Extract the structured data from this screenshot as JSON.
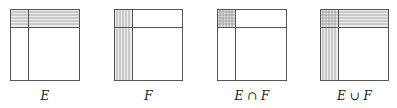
{
  "figure": {
    "stroke_color": "#555555",
    "hatch_color": "#8c8c8c",
    "panels": [
      {
        "id": "E",
        "label": "E",
        "box": {
          "x": 10,
          "y": 9,
          "w": 70,
          "h": 72
        },
        "split": {
          "x": 28,
          "y": 27
        },
        "hatch": [
          "horizontal-top-strip"
        ]
      },
      {
        "id": "F",
        "label": "F",
        "box": {
          "x": 114,
          "y": 9,
          "w": 69,
          "h": 72
        },
        "split": {
          "x": 132,
          "y": 27
        },
        "hatch": [
          "vertical-left-strip"
        ]
      },
      {
        "id": "E-intersect-F",
        "label": "E ∩ F",
        "box": {
          "x": 217,
          "y": 9,
          "w": 70,
          "h": 72
        },
        "split": {
          "x": 235,
          "y": 27
        },
        "hatch": [
          "crosshatch-corner"
        ]
      },
      {
        "id": "E-union-F",
        "label": "E ∪ F",
        "box": {
          "x": 320,
          "y": 9,
          "w": 69,
          "h": 72
        },
        "split": {
          "x": 338,
          "y": 27
        },
        "hatch": [
          "horizontal-top-strip",
          "vertical-left-strip"
        ]
      }
    ]
  }
}
